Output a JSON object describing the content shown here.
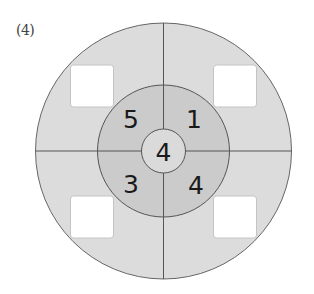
{
  "problem_label": "(4)",
  "colors": {
    "outer_ring": "#dcdcdc",
    "middle_ring": "#cbcbcb",
    "inner_circle": "#dadada",
    "stroke": "#555555",
    "answer_box": "#ffffff",
    "answer_box_border": "#c4c4c4"
  },
  "center_value": "4",
  "middle_ring_values": {
    "top_left": "5",
    "top_right": "1",
    "bottom_left": "3",
    "bottom_right": "4"
  },
  "answer_boxes": {
    "top_left": "",
    "top_right": "",
    "bottom_left": "",
    "bottom_right": ""
  }
}
